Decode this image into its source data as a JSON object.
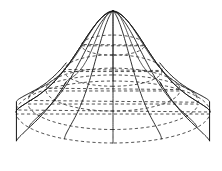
{
  "figure": {
    "kind": "3d-wireframe-surface",
    "canvas": {
      "width": 222,
      "height": 171,
      "background": "#ffffff"
    },
    "stroke_color": "#1a1a1a",
    "hidden_stroke_color": "#333333",
    "stroke_width": 0.9
  },
  "chart_data": {
    "type": "line",
    "xlabel": "",
    "ylabel": "",
    "grid": false,
    "legend": null,
    "projection": {
      "type": "oblique-axonometric",
      "apex_px": [
        113,
        11
      ],
      "center_px": [
        113,
        112
      ],
      "base_radius_x_px": 97,
      "base_radius_y_px": 31,
      "viewer_tilt": 0.32
    },
    "profile_note": "radius r(t) grows with a flare; height z(t) falls from apex to base; silhouette shows an outward fold lobe on each flank",
    "profile_samples": [
      {
        "t": 0.0,
        "r": 0.0,
        "z": 1.0
      },
      {
        "t": 0.06,
        "r": 0.048,
        "z": 0.985
      },
      {
        "t": 0.12,
        "r": 0.098,
        "z": 0.952
      },
      {
        "t": 0.18,
        "r": 0.152,
        "z": 0.9
      },
      {
        "t": 0.24,
        "r": 0.208,
        "z": 0.832
      },
      {
        "t": 0.3,
        "r": 0.266,
        "z": 0.752
      },
      {
        "t": 0.36,
        "r": 0.326,
        "z": 0.662
      },
      {
        "t": 0.42,
        "r": 0.39,
        "z": 0.568
      },
      {
        "t": 0.48,
        "r": 0.458,
        "z": 0.472
      },
      {
        "t": 0.54,
        "r": 0.532,
        "z": 0.38
      },
      {
        "t": 0.6,
        "r": 0.61,
        "z": 0.296
      },
      {
        "t": 0.66,
        "r": 0.692,
        "z": 0.222
      },
      {
        "t": 0.72,
        "r": 0.776,
        "z": 0.16
      },
      {
        "t": 0.78,
        "r": 0.858,
        "z": 0.11
      },
      {
        "t": 0.84,
        "r": 0.924,
        "z": 0.07
      },
      {
        "t": 0.9,
        "r": 0.97,
        "z": 0.04
      },
      {
        "t": 0.95,
        "r": 0.993,
        "z": 0.018
      },
      {
        "t": 1.0,
        "r": 1.0,
        "z": 0.0
      }
    ],
    "meridians": {
      "count": 12,
      "style": "solid",
      "angles_deg": [
        0,
        30,
        60,
        90,
        120,
        150,
        180,
        210,
        240,
        270,
        300,
        330
      ]
    },
    "latitudes": {
      "count": 5,
      "t_values": [
        0.36,
        0.52,
        0.66,
        0.8,
        1.0
      ],
      "front_style": "solid-or-dashed",
      "back_style": "dashed",
      "note": "back halves of the latitude circles are drawn dashed to indicate hidden lines; the lowest rim circle is dashed across the near side"
    },
    "silhouette": {
      "present": true,
      "note": "outer profile curves sweep from apex down and flare outward, folding into a pointed cusp lobe on each flank near mid-height"
    }
  }
}
